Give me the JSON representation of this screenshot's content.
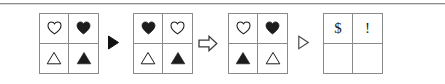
{
  "canvas": {
    "width": 445,
    "height": 84,
    "background": "#ffffff",
    "rule_color": "#8f8f8f",
    "border_color": "#8a8a8a",
    "ink_color": "#1c1c1c"
  },
  "puzzle": {
    "type": "visual-analogy-sequence",
    "panels": [
      {
        "id": "panel-1",
        "x": 39,
        "cells": [
          {
            "position": "top-left",
            "symbol": "heart-outline",
            "label": "♡"
          },
          {
            "position": "top-right",
            "symbol": "heart-filled",
            "label": "♥"
          },
          {
            "position": "bottom-left",
            "symbol": "triangle-outline",
            "label": "△"
          },
          {
            "position": "bottom-right",
            "symbol": "triangle-filled",
            "label": "▲"
          }
        ]
      },
      {
        "id": "panel-2",
        "x": 133,
        "cells": [
          {
            "position": "top-left",
            "symbol": "heart-filled",
            "label": "♥"
          },
          {
            "position": "top-right",
            "symbol": "heart-outline",
            "label": "♡"
          },
          {
            "position": "bottom-left",
            "symbol": "triangle-outline",
            "label": "△"
          },
          {
            "position": "bottom-right",
            "symbol": "triangle-filled",
            "label": "▲"
          }
        ]
      },
      {
        "id": "panel-3",
        "x": 228,
        "cells": [
          {
            "position": "top-left",
            "symbol": "heart-outline",
            "label": "♡"
          },
          {
            "position": "top-right",
            "symbol": "heart-filled",
            "label": "♥"
          },
          {
            "position": "bottom-left",
            "symbol": "triangle-filled",
            "label": "▲"
          },
          {
            "position": "bottom-right",
            "symbol": "triangle-outline",
            "label": "△"
          }
        ]
      },
      {
        "id": "panel-4",
        "x": 323,
        "cells": [
          {
            "position": "top-left",
            "symbol": "dollar-sign",
            "label": "$"
          },
          {
            "position": "top-right",
            "symbol": "exclamation-mark",
            "label": "!"
          },
          {
            "position": "bottom-left",
            "symbol": "empty",
            "label": ""
          },
          {
            "position": "bottom-right",
            "symbol": "empty",
            "label": ""
          }
        ]
      }
    ],
    "separators": [
      {
        "id": "separator-1",
        "x": 107,
        "symbol": "triangle-right-filled",
        "label": "▶"
      },
      {
        "id": "separator-2",
        "x": 198,
        "symbol": "block-arrow-right-outline",
        "label": "⇨"
      },
      {
        "id": "separator-3",
        "x": 297,
        "symbol": "triangle-right-outline",
        "label": "▷"
      }
    ]
  }
}
